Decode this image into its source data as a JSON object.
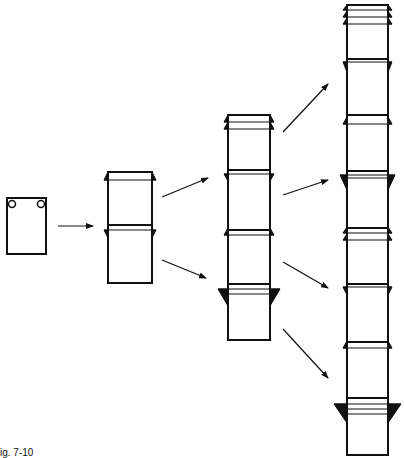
{
  "figure": {
    "caption": "ig. 7-10",
    "stroke_color": "#111111",
    "background": "#ffffff"
  },
  "stages": [
    {
      "id": "stage-1",
      "label": "single sheet with two corner holes",
      "segments": 1
    },
    {
      "id": "stage-2",
      "label": "two joined segments",
      "segments": 2
    },
    {
      "id": "stage-3",
      "label": "four joined segments",
      "segments": 4
    },
    {
      "id": "stage-4",
      "label": "eight joined segments",
      "segments": 8
    }
  ],
  "arrows": [
    {
      "from": "stage-1",
      "to": "stage-2",
      "count": 1
    },
    {
      "from": "stage-2",
      "to": "stage-3",
      "count": 2
    },
    {
      "from": "stage-3",
      "to": "stage-4",
      "count": 4
    }
  ]
}
